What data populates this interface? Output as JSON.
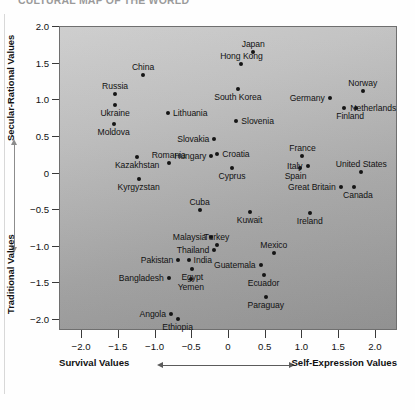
{
  "figure": {
    "title": "CULTURAL MAP OF THE WORLD"
  },
  "chart_data": {
    "type": "scatter",
    "title": "CULTURAL MAP OF THE WORLD",
    "xlabel": "Survival Values ↔ Self-Expression Values",
    "ylabel": "Traditional Values ↔ Secular-Rational Values",
    "xlim": [
      -2.3,
      2.3
    ],
    "ylim": [
      -2.15,
      2.0
    ],
    "grid": false,
    "legend": null,
    "xticks": [
      "−2.0",
      "−1.5",
      "−1.0",
      "−0.5",
      "0",
      "0.5",
      "1.0",
      "1.5",
      "2.0"
    ],
    "xtick_values": [
      -2.0,
      -1.5,
      -1.0,
      -0.5,
      0,
      0.5,
      1.0,
      1.5,
      2.0
    ],
    "yticks": [
      "2.0",
      "1.5",
      "1.0",
      "0.5",
      "0",
      "−0.5",
      "−1.0",
      "−1.5",
      "−2.0"
    ],
    "ytick_values": [
      2.0,
      1.5,
      1.0,
      0.5,
      0,
      -0.5,
      -1.0,
      -1.5,
      -2.0
    ],
    "axis_captions": {
      "y_top": "Secular-Rational Values",
      "y_bottom": "Traditional Values",
      "x_left": "Survival Values",
      "x_right": "Self-Expression Values"
    },
    "points": [
      {
        "label": "Japan",
        "x": 0.33,
        "y": 1.66,
        "lp": "above",
        "dx": 0
      },
      {
        "label": "Hong Kong",
        "x": 0.17,
        "y": 1.5,
        "lp": "above",
        "dx": 0
      },
      {
        "label": "China",
        "x": -1.17,
        "y": 1.34,
        "lp": "above",
        "dx": 0
      },
      {
        "label": "South Korea",
        "x": 0.12,
        "y": 1.16,
        "lp": "below",
        "dx": 0
      },
      {
        "label": "Norway",
        "x": 1.82,
        "y": 1.13,
        "lp": "above",
        "dx": 0
      },
      {
        "label": "Russia",
        "x": -1.55,
        "y": 1.08,
        "lp": "above",
        "dx": 0
      },
      {
        "label": "Netherlands",
        "x": 1.57,
        "y": 0.9,
        "lp": "right",
        "dx": 6
      },
      {
        "label": "Germany",
        "x": 1.37,
        "y": 1.03,
        "lp": "left",
        "dx": -5
      },
      {
        "label": "Finland",
        "x": 1.73,
        "y": 0.9,
        "lp": "below",
        "dx": -6
      },
      {
        "label": "Ukraine",
        "x": -1.55,
        "y": 0.93,
        "lp": "below",
        "dx": 0
      },
      {
        "label": "Lithuania",
        "x": -0.83,
        "y": 0.82,
        "lp": "right",
        "dx": 5
      },
      {
        "label": "Slovenia",
        "x": 0.1,
        "y": 0.72,
        "lp": "right",
        "dx": 5
      },
      {
        "label": "Moldova",
        "x": -1.57,
        "y": 0.68,
        "lp": "below",
        "dx": 0
      },
      {
        "label": "Slovakia",
        "x": -0.2,
        "y": 0.47,
        "lp": "left",
        "dx": -5
      },
      {
        "label": "Kazakhstan",
        "x": -1.25,
        "y": 0.22,
        "lp": "below",
        "dx": 0
      },
      {
        "label": "Hungary",
        "x": -0.24,
        "y": 0.24,
        "lp": "left",
        "dx": -5
      },
      {
        "label": "Croatia",
        "x": -0.16,
        "y": 0.26,
        "lp": "right",
        "dx": 5
      },
      {
        "label": "France",
        "x": 1.0,
        "y": 0.24,
        "lp": "above",
        "dx": 0
      },
      {
        "label": "Italy",
        "x": 1.07,
        "y": 0.1,
        "lp": "left",
        "dx": -5
      },
      {
        "label": "Romania",
        "x": -0.82,
        "y": 0.14,
        "lp": "above",
        "dx": 0
      },
      {
        "label": "Cyprus",
        "x": 0.04,
        "y": 0.07,
        "lp": "below",
        "dx": 0
      },
      {
        "label": "Spain",
        "x": 0.96,
        "y": 0.08,
        "lp": "below",
        "dx": -4
      },
      {
        "label": "United States",
        "x": 1.8,
        "y": 0.02,
        "lp": "above",
        "dx": 0
      },
      {
        "label": "Kyrgyzstan",
        "x": -1.23,
        "y": -0.07,
        "lp": "below",
        "dx": 0
      },
      {
        "label": "Great Britain",
        "x": 1.52,
        "y": -0.18,
        "lp": "left",
        "dx": -5
      },
      {
        "label": "Canada",
        "x": 1.7,
        "y": -0.18,
        "lp": "below",
        "dx": 4
      },
      {
        "label": "Cuba",
        "x": -0.4,
        "y": -0.5,
        "lp": "above",
        "dx": 0
      },
      {
        "label": "Kuwait",
        "x": 0.28,
        "y": -0.52,
        "lp": "below",
        "dx": 0
      },
      {
        "label": "Ireland",
        "x": 1.1,
        "y": -0.54,
        "lp": "below",
        "dx": 0
      },
      {
        "label": "Malaysia",
        "x": -0.24,
        "y": -0.86,
        "lp": "left",
        "dx": -5
      },
      {
        "label": "Turkey",
        "x": -0.17,
        "y": -0.98,
        "lp": "above",
        "dx": 0
      },
      {
        "label": "Thailand",
        "x": -0.2,
        "y": -1.05,
        "lp": "left",
        "dx": -5
      },
      {
        "label": "Mexico",
        "x": 0.61,
        "y": -1.08,
        "lp": "above",
        "dx": 0
      },
      {
        "label": "Pakistan",
        "x": -0.69,
        "y": -1.18,
        "lp": "left",
        "dx": -5
      },
      {
        "label": "India",
        "x": -0.55,
        "y": -1.18,
        "lp": "right",
        "dx": 5
      },
      {
        "label": "Guatemala",
        "x": 0.43,
        "y": -1.25,
        "lp": "left",
        "dx": -5
      },
      {
        "label": "Egypt",
        "x": -0.5,
        "y": -1.31,
        "lp": "below",
        "dx": 0
      },
      {
        "label": "Bangladesh",
        "x": -0.82,
        "y": -1.42,
        "lp": "left",
        "dx": -5
      },
      {
        "label": "Ecuador",
        "x": 0.47,
        "y": -1.38,
        "lp": "below",
        "dx": 0
      },
      {
        "label": "Yemen",
        "x": -0.52,
        "y": -1.44,
        "lp": "below",
        "dx": 0
      },
      {
        "label": "Paraguay",
        "x": 0.5,
        "y": -1.69,
        "lp": "below",
        "dx": 0
      },
      {
        "label": "Angola",
        "x": -0.79,
        "y": -1.92,
        "lp": "left",
        "dx": -5
      },
      {
        "label": "Ethiopia",
        "x": -0.7,
        "y": -1.98,
        "lp": "below",
        "dx": 0
      }
    ]
  }
}
